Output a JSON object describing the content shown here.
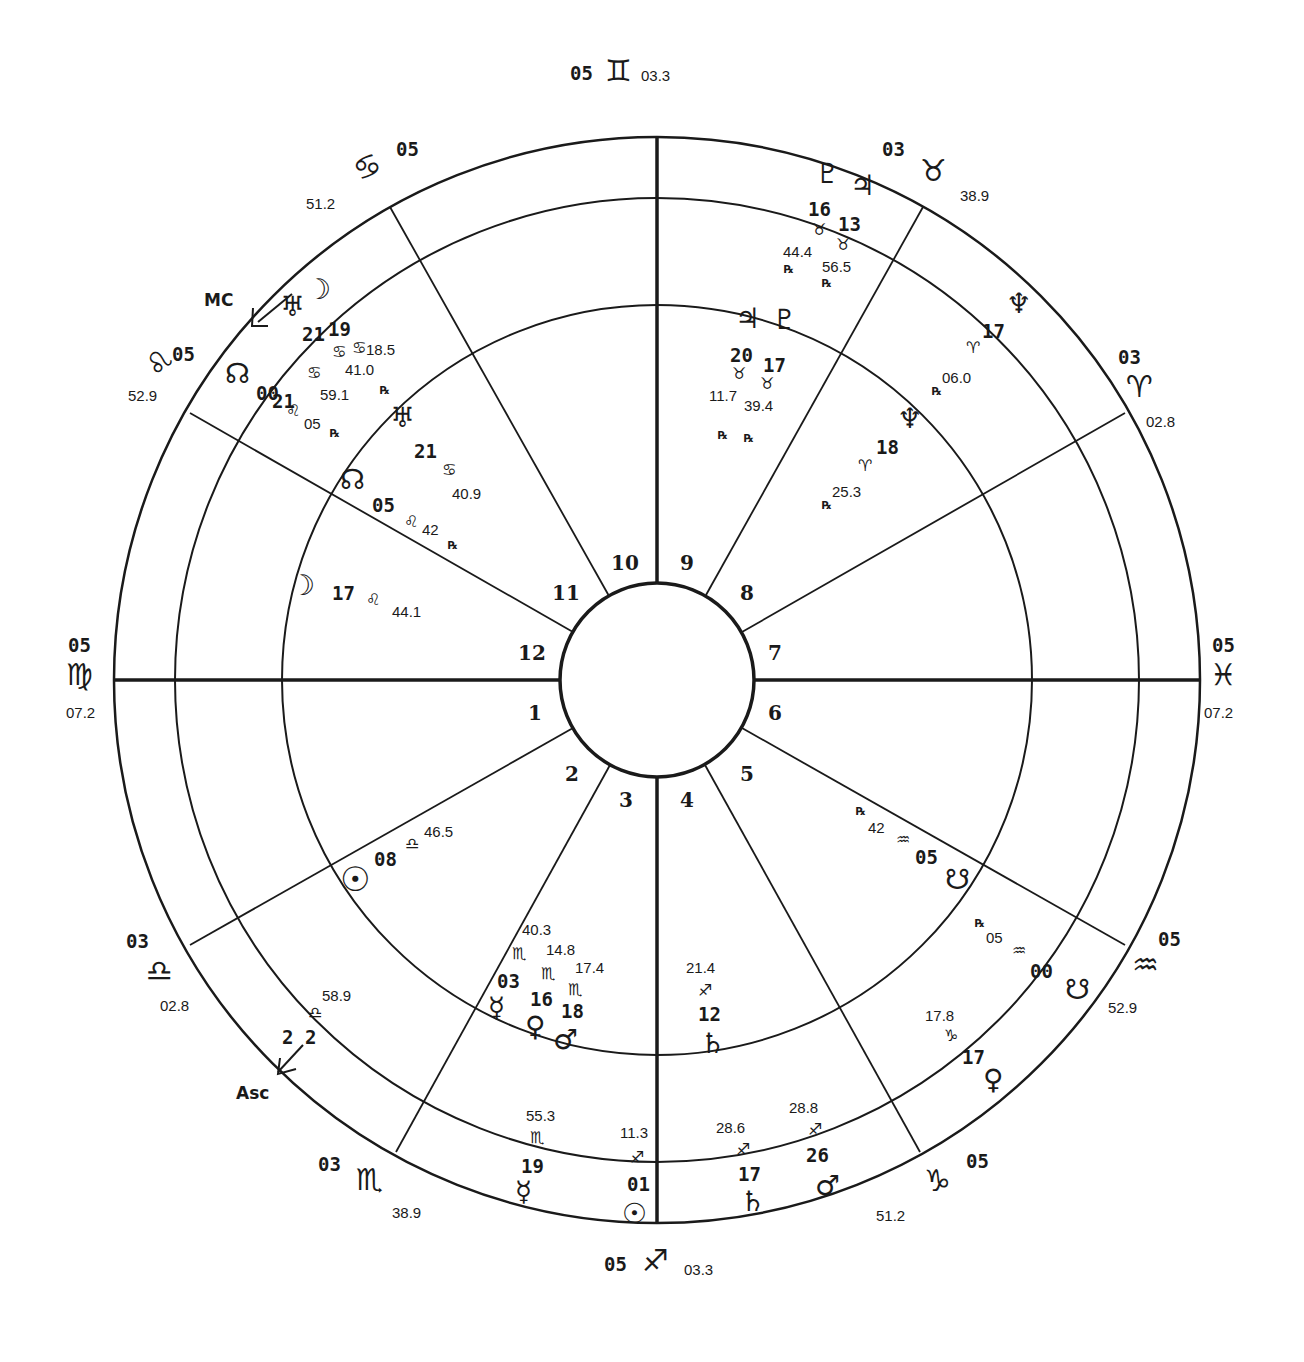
{
  "chart": {
    "type": "bi-wheel natal/transit astrological chart",
    "center": [
      657,
      680
    ],
    "outer_radius": 543,
    "sign_ring_radius": 482,
    "middle_ring_radius": 375,
    "inner_radius": 97,
    "stroke_color": "#1a1a1a",
    "background": "#ffffff"
  },
  "cusps": [
    {
      "house": "1",
      "deg": "05",
      "sign_glyph": "♍",
      "sign": "Virgo",
      "min": "07.2",
      "axis": "ASC-side"
    },
    {
      "house": "12",
      "deg": "05",
      "sign_glyph": "♌",
      "sign": "Leo",
      "min": "52.9"
    },
    {
      "house": "11",
      "deg": "05",
      "sign_glyph": "♋",
      "sign": "Cancer",
      "min": "51.2"
    },
    {
      "house": "10",
      "deg": "05",
      "sign_glyph": "♊",
      "sign": "Gemini",
      "min": "03.3"
    },
    {
      "house": "9",
      "deg": "03",
      "sign_glyph": "♉",
      "sign": "Taurus",
      "min": "38.9"
    },
    {
      "house": "8",
      "deg": "03",
      "sign_glyph": "♈",
      "sign": "Aries",
      "min": "02.8"
    },
    {
      "house": "7",
      "deg": "05",
      "sign_glyph": "♓",
      "sign": "Pisces",
      "min": "07.2"
    },
    {
      "house": "6",
      "deg": "05",
      "sign_glyph": "♒",
      "sign": "Aquarius",
      "min": "52.9"
    },
    {
      "house": "5",
      "deg": "05",
      "sign_glyph": "♑",
      "sign": "Capricorn",
      "min": "51.2"
    },
    {
      "house": "4",
      "deg": "05",
      "sign_glyph": "♐",
      "sign": "Sagittarius",
      "min": "03.3"
    },
    {
      "house": "3",
      "deg": "03",
      "sign_glyph": "♏",
      "sign": "Scorpio",
      "min": "38.9"
    },
    {
      "house": "2",
      "deg": "03",
      "sign_glyph": "♎",
      "sign": "Libra",
      "min": "02.8"
    }
  ],
  "house_numbers": [
    "1",
    "2",
    "3",
    "4",
    "5",
    "6",
    "7",
    "8",
    "9",
    "10",
    "11",
    "12"
  ],
  "angles": {
    "mc": {
      "label": "MC",
      "deg": "21",
      "sign_glyph": "♋",
      "min": "41.0"
    },
    "asc": {
      "label": "Asc",
      "deg": "2 2",
      "sign_glyph": "♎",
      "min": "58.9"
    }
  },
  "outer_planets": [
    {
      "name": "Pluto",
      "glyph": "♇",
      "deg": "16",
      "sign_glyph": "♉",
      "min": "44.4",
      "retro": "℞"
    },
    {
      "name": "Jupiter",
      "glyph": "♃",
      "deg": "13",
      "sign_glyph": "♉",
      "min": "56.5",
      "retro": "℞"
    },
    {
      "name": "Neptune",
      "glyph": "♆",
      "deg": "17",
      "sign_glyph": "♈",
      "min": "06.0",
      "retro": "℞"
    },
    {
      "name": "Moon",
      "glyph": "☽",
      "deg": "19",
      "sign_glyph": "♋",
      "min": "18.5",
      "retro": ""
    },
    {
      "name": "Uranus",
      "glyph": "♅",
      "deg": "21",
      "sign_glyph": "♋",
      "min": "41.0",
      "retro": "℞"
    },
    {
      "name": "North Node",
      "glyph": "☊",
      "deg": "00",
      "sign_glyph": "♌",
      "min": "05",
      "retro": "℞"
    },
    {
      "name": "Mercury",
      "glyph": "☿",
      "deg": "19",
      "sign_glyph": "♏",
      "min": "55.3",
      "retro": ""
    },
    {
      "name": "Sun",
      "glyph": "☉",
      "deg": "01",
      "sign_glyph": "♐",
      "min": "11.3",
      "retro": ""
    },
    {
      "name": "Saturn",
      "glyph": "♄",
      "deg": "17",
      "sign_glyph": "♐",
      "min": "28.6",
      "retro": ""
    },
    {
      "name": "Mars",
      "glyph": "♂",
      "deg": "26",
      "sign_glyph": "♐",
      "min": "28.8",
      "retro": ""
    },
    {
      "name": "Venus",
      "glyph": "♀",
      "deg": "17",
      "sign_glyph": "♑",
      "min": "17.8",
      "retro": ""
    },
    {
      "name": "South Node",
      "glyph": "☋",
      "deg": "00",
      "sign_glyph": "♒",
      "min": "05",
      "retro": "℞"
    }
  ],
  "inner_planets": [
    {
      "name": "Jupiter",
      "glyph": "♃",
      "deg": "20",
      "sign_glyph": "♉",
      "min": "11.7",
      "retro": "℞"
    },
    {
      "name": "Pluto",
      "glyph": "♇",
      "deg": "17",
      "sign_glyph": "♉",
      "min": "39.4",
      "retro": "℞"
    },
    {
      "name": "Neptune",
      "glyph": "♆",
      "deg": "18",
      "sign_glyph": "♈",
      "min": "25.3",
      "retro": "℞"
    },
    {
      "name": "Uranus",
      "glyph": "♅",
      "deg": "21",
      "sign_glyph": "♋",
      "min": "40.9",
      "retro": ""
    },
    {
      "name": "North Node",
      "glyph": "☊",
      "deg": "05",
      "sign_glyph": "♌",
      "min": "42",
      "retro": "℞"
    },
    {
      "name": "Moon",
      "glyph": "☽",
      "deg": "17",
      "sign_glyph": "♌",
      "min": "44.1",
      "retro": ""
    },
    {
      "name": "Sun",
      "glyph": "☉",
      "deg": "08",
      "sign_glyph": "♎",
      "min": "46.5",
      "retro": ""
    },
    {
      "name": "Mercury",
      "glyph": "☿",
      "deg": "03",
      "sign_glyph": "♏",
      "min": "40.3",
      "retro": ""
    },
    {
      "name": "Venus",
      "glyph": "♀",
      "deg": "16",
      "sign_glyph": "♏",
      "min": "14.8",
      "retro": ""
    },
    {
      "name": "Mars",
      "glyph": "♂",
      "deg": "18",
      "sign_glyph": "♏",
      "min": "17.4",
      "retro": ""
    },
    {
      "name": "Saturn",
      "glyph": "♄",
      "deg": "12",
      "sign_glyph": "♐",
      "min": "21.4",
      "retro": ""
    },
    {
      "name": "South Node",
      "glyph": "☋",
      "deg": "05",
      "sign_glyph": "♒",
      "min": "42",
      "retro": "℞"
    }
  ]
}
